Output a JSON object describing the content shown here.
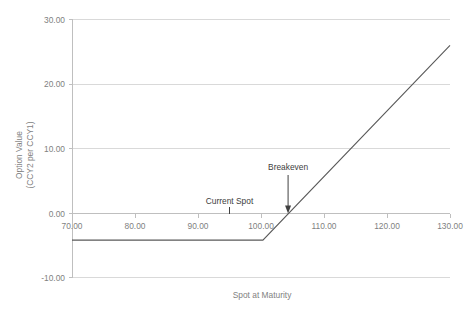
{
  "chart_data": {
    "type": "line",
    "title": "",
    "xlabel": "Spot at Maturity",
    "ylabel_line1": "Option Value",
    "ylabel_line2": "(CCY2 per CCY1)",
    "xlim": [
      70,
      130
    ],
    "ylim": [
      -10,
      30
    ],
    "xticks": [
      70,
      80,
      90,
      100,
      110,
      120,
      130
    ],
    "xtick_labels": [
      "70.00",
      "80.00",
      "90.00",
      "100.00",
      "110.00",
      "120.00",
      "130.00"
    ],
    "yticks": [
      -10,
      0,
      10,
      20,
      30
    ],
    "ytick_labels": [
      "-10.00",
      "0.00",
      "10.00",
      "20.00",
      "30.00"
    ],
    "grid": "horizontal",
    "legend": "none",
    "series": [
      {
        "name": "Option payoff at maturity",
        "color": "#595959",
        "x": [
          70,
          100.3,
          130
        ],
        "values": [
          -4.2,
          -4.2,
          26.0
        ]
      }
    ],
    "annotations": [
      {
        "id": "current-spot",
        "label": "Current Spot",
        "x": 95,
        "y": 0,
        "marker": "tick"
      },
      {
        "id": "breakeven",
        "label": "Breakeven",
        "x": 104.3,
        "y": 0,
        "marker": "arrow"
      }
    ]
  }
}
